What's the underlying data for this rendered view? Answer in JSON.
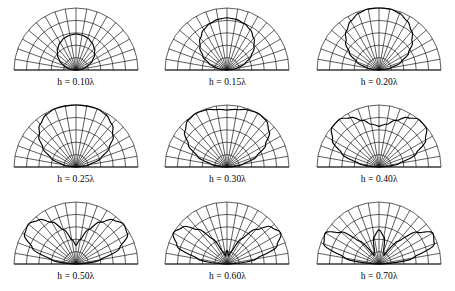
{
  "figure": {
    "rows": 3,
    "columns": 3
  },
  "chart_data": {
    "type": "line",
    "subtype": "polar-half-plane",
    "xlabel": "",
    "ylabel": "",
    "grid": true,
    "legend_position": "none",
    "polar": {
      "angle_range_deg": [
        0,
        180
      ],
      "spoke_interval_deg": 10,
      "spoke_count": 19,
      "arc_count": 5,
      "radial_range_normalized": [
        0,
        1
      ],
      "arc_radii_normalized": [
        0.2,
        0.4,
        0.6,
        0.8,
        1.0
      ]
    },
    "panels": [
      {
        "label": "h = 0.10λ",
        "height_lambda": 0.1,
        "lobes": 1,
        "peak_angle_deg": 90,
        "angles_deg": [
          0,
          10,
          20,
          30,
          40,
          50,
          60,
          70,
          80,
          90,
          100,
          110,
          120,
          130,
          140,
          150,
          160,
          170,
          180
        ],
        "values": [
          0.0,
          0.11,
          0.21,
          0.31,
          0.39,
          0.46,
          0.51,
          0.55,
          0.57,
          0.58,
          0.57,
          0.55,
          0.51,
          0.46,
          0.39,
          0.31,
          0.21,
          0.11,
          0.0
        ]
      },
      {
        "label": "h = 0.15λ",
        "height_lambda": 0.15,
        "lobes": 1,
        "peak_angle_deg": 90,
        "angles_deg": [
          0,
          10,
          20,
          30,
          40,
          50,
          60,
          70,
          80,
          90,
          100,
          110,
          120,
          130,
          140,
          150,
          160,
          170,
          180
        ],
        "values": [
          0.0,
          0.16,
          0.31,
          0.45,
          0.57,
          0.67,
          0.75,
          0.8,
          0.83,
          0.84,
          0.83,
          0.8,
          0.75,
          0.67,
          0.57,
          0.45,
          0.31,
          0.16,
          0.0
        ]
      },
      {
        "label": "h = 0.20λ",
        "height_lambda": 0.2,
        "lobes": 1,
        "peak_angle_deg": 90,
        "angles_deg": [
          0,
          10,
          20,
          30,
          40,
          50,
          60,
          70,
          80,
          90,
          100,
          110,
          120,
          130,
          140,
          150,
          160,
          170,
          180
        ],
        "values": [
          0.0,
          0.19,
          0.38,
          0.55,
          0.7,
          0.82,
          0.91,
          0.97,
          1.0,
          1.0,
          1.0,
          0.97,
          0.91,
          0.82,
          0.7,
          0.55,
          0.38,
          0.19,
          0.0
        ]
      },
      {
        "label": "h = 0.25λ",
        "height_lambda": 0.25,
        "lobes": 1,
        "peak_angle_deg": 90,
        "angles_deg": [
          0,
          10,
          20,
          30,
          40,
          50,
          60,
          70,
          80,
          90,
          100,
          110,
          120,
          130,
          140,
          150,
          160,
          170,
          180
        ],
        "values": [
          0.0,
          0.22,
          0.43,
          0.62,
          0.78,
          0.9,
          0.97,
          1.0,
          1.0,
          1.0,
          1.0,
          1.0,
          0.97,
          0.9,
          0.78,
          0.62,
          0.43,
          0.22,
          0.0
        ]
      },
      {
        "label": "h = 0.30λ",
        "height_lambda": 0.3,
        "lobes": 1,
        "peak_angle_deg": 56,
        "angles_deg": [
          0,
          10,
          20,
          30,
          40,
          50,
          60,
          70,
          80,
          90,
          100,
          110,
          120,
          130,
          140,
          150,
          160,
          170,
          180
        ],
        "values": [
          0.0,
          0.26,
          0.51,
          0.72,
          0.89,
          0.98,
          1.0,
          0.98,
          0.94,
          0.92,
          0.94,
          0.98,
          1.0,
          0.98,
          0.89,
          0.72,
          0.51,
          0.26,
          0.0
        ]
      },
      {
        "label": "h = 0.40λ",
        "height_lambda": 0.4,
        "lobes": 2,
        "peak_angle_deg": 39,
        "angles_deg": [
          0,
          10,
          20,
          30,
          40,
          50,
          60,
          70,
          80,
          90,
          100,
          110,
          120,
          130,
          140,
          150,
          160,
          170,
          180
        ],
        "values": [
          0.0,
          0.33,
          0.64,
          0.87,
          0.99,
          1.0,
          0.92,
          0.8,
          0.7,
          0.66,
          0.7,
          0.8,
          0.92,
          1.0,
          0.99,
          0.87,
          0.64,
          0.33,
          0.0
        ]
      },
      {
        "label": "h = 0.50λ",
        "height_lambda": 0.5,
        "lobes": 2,
        "peak_angle_deg": 30,
        "angles_deg": [
          0,
          10,
          20,
          30,
          40,
          50,
          60,
          70,
          80,
          90,
          100,
          110,
          120,
          130,
          140,
          150,
          160,
          170,
          180
        ],
        "values": [
          0.0,
          0.4,
          0.75,
          0.96,
          1.0,
          0.93,
          0.78,
          0.59,
          0.4,
          0.3,
          0.4,
          0.59,
          0.78,
          0.93,
          1.0,
          0.96,
          0.75,
          0.4,
          0.0
        ]
      },
      {
        "label": "h = 0.60λ",
        "height_lambda": 0.6,
        "lobes": 2,
        "peak_angle_deg": 25,
        "angles_deg": [
          0,
          10,
          20,
          30,
          40,
          50,
          60,
          70,
          80,
          90,
          100,
          110,
          120,
          130,
          140,
          150,
          160,
          170,
          180
        ],
        "values": [
          0.0,
          0.48,
          0.86,
          1.0,
          0.93,
          0.73,
          0.47,
          0.22,
          0.13,
          0.22,
          0.13,
          0.22,
          0.47,
          0.73,
          0.93,
          1.0,
          0.86,
          0.48,
          0.0
        ]
      },
      {
        "label": "h = 0.70λ",
        "height_lambda": 0.7,
        "lobes": 3,
        "peak_angle_deg": 21,
        "angles_deg": [
          0,
          10,
          20,
          30,
          40,
          50,
          60,
          70,
          80,
          90,
          100,
          110,
          120,
          130,
          140,
          150,
          160,
          170,
          180
        ],
        "values": [
          0.0,
          0.56,
          0.95,
          1.0,
          0.8,
          0.48,
          0.16,
          0.22,
          0.45,
          0.55,
          0.45,
          0.22,
          0.16,
          0.48,
          0.8,
          1.0,
          0.95,
          0.56,
          0.0
        ]
      }
    ]
  },
  "colors": {
    "background": "#ffffff",
    "grid": "#1a1a1a",
    "pattern": "#000000",
    "text": "#000000"
  }
}
